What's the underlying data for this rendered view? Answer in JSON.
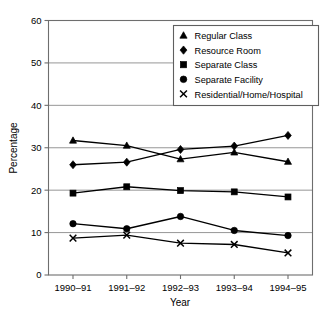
{
  "chart_data": {
    "type": "line",
    "title": "",
    "xlabel": "Year",
    "ylabel": "Percentage",
    "categories": [
      "1990–91",
      "1991–92",
      "1992–93",
      "1993–94",
      "1994–95"
    ],
    "ylim": [
      0,
      60
    ],
    "ytick_labels": [
      "0",
      "10",
      "20",
      "30",
      "40",
      "50",
      "60"
    ],
    "ytick_values": [
      0,
      10,
      20,
      30,
      40,
      50,
      60
    ],
    "grid": true,
    "grid_axis": "y",
    "legend_position": "top-right",
    "series": [
      {
        "name": "Regular Class",
        "marker": "triangle",
        "color": "#000000",
        "values": [
          31.7,
          30.5,
          27.3,
          28.9,
          26.7
        ]
      },
      {
        "name": "Resource Room",
        "marker": "diamond",
        "color": "#000000",
        "values": [
          26.0,
          26.6,
          29.6,
          30.4,
          32.9
        ]
      },
      {
        "name": "Separate Class",
        "marker": "square",
        "color": "#000000",
        "values": [
          19.3,
          20.8,
          19.9,
          19.6,
          18.4
        ]
      },
      {
        "name": "Separate Facility",
        "marker": "circle",
        "color": "#000000",
        "values": [
          12.1,
          10.9,
          13.8,
          10.5,
          9.3
        ]
      },
      {
        "name": "Residential/Home/Hospital",
        "marker": "cross",
        "color": "#000000",
        "values": [
          8.7,
          9.4,
          7.5,
          7.2,
          5.2
        ]
      }
    ]
  },
  "legend": {
    "items": [
      {
        "label": "Regular Class",
        "marker": "triangle"
      },
      {
        "label": "Resource Room",
        "marker": "diamond"
      },
      {
        "label": "Separate Class",
        "marker": "square"
      },
      {
        "label": "Separate Facility",
        "marker": "circle"
      },
      {
        "label": "Residential/Home/Hospital",
        "marker": "cross"
      }
    ]
  }
}
